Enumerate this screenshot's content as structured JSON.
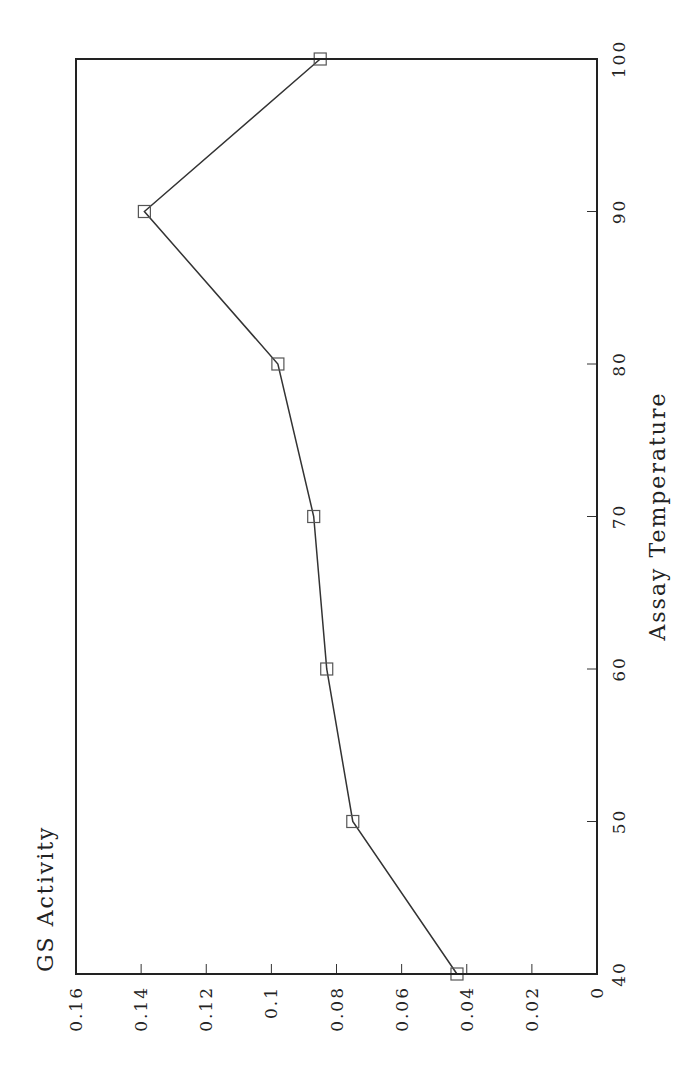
{
  "chart_data": {
    "type": "line",
    "title": "",
    "xlabel": "Assay Temperature",
    "ylabel": "GS Activity",
    "x": [
      40,
      50,
      60,
      70,
      80,
      90,
      100
    ],
    "series": [
      {
        "name": "GS Activity",
        "marker": "open-square",
        "values": [
          0.043,
          0.075,
          0.083,
          0.087,
          0.098,
          0.139,
          0.085
        ]
      }
    ],
    "xlim": [
      40,
      100
    ],
    "ylim": [
      0,
      0.16
    ],
    "xticks": [
      "40",
      "50",
      "60",
      "70",
      "80",
      "90",
      "100"
    ],
    "yticks": [
      "0",
      "0.02",
      "0.04",
      "0.06",
      "0.08",
      "0.1",
      "0.12",
      "0.14",
      "0.16"
    ],
    "grid": false,
    "legend": "none",
    "orientation": "rotated 90 degrees counter-clockwise"
  },
  "colors": {
    "line": "#333333",
    "frame": "#222222",
    "background": "#ffffff"
  }
}
